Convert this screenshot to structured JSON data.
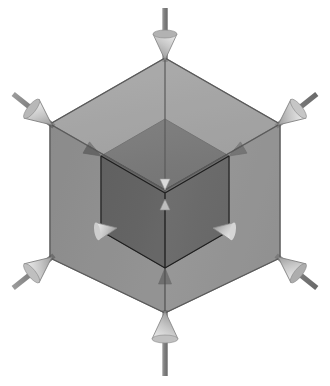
{
  "figure": {
    "title": "Isometric cube under uniform inward compression",
    "background_color": "#ffffff",
    "projection": "isometric",
    "center": {
      "x": 165,
      "y": 198
    }
  },
  "outer_cube": {
    "name": "outer-cube",
    "label": "Outer translucent cube",
    "opacity": 0.78,
    "half_width": 115,
    "half_height": 67,
    "vertical_half": 73,
    "vertices": {
      "top": {
        "x": 165,
        "y": 58
      },
      "upper_left": {
        "x": 50,
        "y": 124
      },
      "upper_right": {
        "x": 280,
        "y": 124
      },
      "center": {
        "x": 165,
        "y": 190
      },
      "lower_left": {
        "x": 50,
        "y": 258
      },
      "lower_right": {
        "x": 280,
        "y": 258
      },
      "bottom": {
        "x": 165,
        "y": 313
      }
    },
    "faces": [
      {
        "name": "top-face",
        "fill": "#8d8d8d"
      },
      {
        "name": "left-face",
        "fill": "#6e6e6e"
      },
      {
        "name": "right-face",
        "fill": "#7b7b7b"
      }
    ],
    "edge_color": "#5a5a5a",
    "edge_width": 1.1
  },
  "inner_cube": {
    "name": "inner-cube",
    "label": "Inner solid cube",
    "opacity": 1,
    "scale": 0.56,
    "vertices": {
      "top": {
        "x": 165,
        "y": 119
      },
      "upper_left": {
        "x": 101,
        "y": 156
      },
      "upper_right": {
        "x": 229,
        "y": 156
      },
      "center": {
        "x": 165,
        "y": 193
      },
      "lower_left": {
        "x": 101,
        "y": 231
      },
      "lower_right": {
        "x": 229,
        "y": 231
      },
      "bottom": {
        "x": 165,
        "y": 268
      }
    },
    "faces": [
      {
        "name": "top-face",
        "fill": "#4e4e4e"
      },
      {
        "name": "left-face",
        "fill": "#2f2f2f"
      },
      {
        "name": "right-face",
        "fill": "#3a3a3a"
      }
    ],
    "edge_color": "#1e1e1e",
    "edge_width": 1.1
  },
  "outer_arrows": [
    {
      "name": "arrow-top",
      "label": "Top compression arrow",
      "direction": "down",
      "tail": {
        "x": 165,
        "y": 10
      },
      "tip": {
        "x": 165,
        "y": 58
      },
      "head_fill": "#b9b9b9",
      "stem_fill": "#8c8c8c"
    },
    {
      "name": "arrow-upper-left",
      "label": "Upper-left compression arrow",
      "direction": "down-right",
      "tail": {
        "x": 14,
        "y": 95
      },
      "tip": {
        "x": 50,
        "y": 124
      },
      "head_fill": "#c2c2c2",
      "stem_fill": "#8c8c8c"
    },
    {
      "name": "arrow-upper-right",
      "label": "Upper-right compression arrow",
      "direction": "down-left",
      "tail": {
        "x": 316,
        "y": 95
      },
      "tip": {
        "x": 280,
        "y": 124
      },
      "head_fill": "#cfcfcf",
      "stem_fill": "#8c8c8c"
    },
    {
      "name": "arrow-lower-left",
      "label": "Lower-left compression arrow",
      "direction": "up-right",
      "tail": {
        "x": 14,
        "y": 288
      },
      "tip": {
        "x": 50,
        "y": 258
      },
      "head_fill": "#c8c8c8",
      "stem_fill": "#8c8c8c"
    },
    {
      "name": "arrow-lower-right",
      "label": "Lower-right compression arrow",
      "direction": "up-left",
      "tail": {
        "x": 316,
        "y": 288
      },
      "tip": {
        "x": 280,
        "y": 258
      },
      "head_fill": "#b5b5b5",
      "stem_fill": "#8c8c8c"
    },
    {
      "name": "arrow-bottom",
      "label": "Bottom compression arrow",
      "direction": "up",
      "tail": {
        "x": 165,
        "y": 378
      },
      "tip": {
        "x": 165,
        "y": 313
      },
      "head_fill": "#c9c9c9",
      "stem_fill": "#8c8c8c"
    }
  ],
  "inner_arrows": [
    {
      "name": "inner-arrow-center-upper",
      "label": "Inner center arrow pointing down",
      "direction": "down",
      "tip": {
        "x": 165,
        "y": 193
      },
      "fill": "#d8d8d8"
    },
    {
      "name": "inner-arrow-center-lower",
      "label": "Inner center arrow pointing up",
      "direction": "up",
      "tip": {
        "x": 165,
        "y": 196
      },
      "fill": "#c0c0c0"
    },
    {
      "name": "inner-arrow-left",
      "label": "Inner left-front vertex arrow",
      "direction": "right",
      "tip": {
        "x": 112,
        "y": 228
      },
      "fill": "#e2e2e2"
    },
    {
      "name": "inner-arrow-right",
      "label": "Inner right-front vertex arrow",
      "direction": "left",
      "tip": {
        "x": 218,
        "y": 228
      },
      "fill": "#eaeaea"
    },
    {
      "name": "inner-arrow-upper-left",
      "label": "Inner upper-left vertex arrow",
      "direction": "down-right",
      "tip": {
        "x": 101,
        "y": 156
      },
      "fill": "#4a4a4a"
    },
    {
      "name": "inner-arrow-upper-right",
      "label": "Inner upper-right vertex arrow",
      "direction": "down-left",
      "tip": {
        "x": 229,
        "y": 156
      },
      "fill": "#6b6b6b"
    },
    {
      "name": "inner-arrow-bottom",
      "label": "Inner bottom vertex arrow",
      "direction": "up",
      "tip": {
        "x": 165,
        "y": 268
      },
      "fill": "#5c5c5c"
    }
  ]
}
